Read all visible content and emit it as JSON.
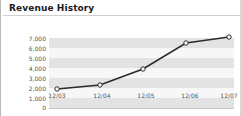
{
  "widget": {
    "title": "Revenue History"
  },
  "chart_data": {
    "type": "line",
    "title": "Revenue History",
    "xlabel": "",
    "ylabel": "",
    "categories": [
      "12/03",
      "12/04",
      "12/05",
      "12/06",
      "12/07"
    ],
    "values": [
      1900,
      2300,
      3900,
      6500,
      7100
    ],
    "series": [
      {
        "name": "Revenue",
        "values": [
          1900,
          2300,
          3900,
          6500,
          7100
        ]
      }
    ],
    "ylim": [
      0,
      7500
    ],
    "ytick_labels": [
      "7,000",
      "6,000",
      "5,000",
      "4,000",
      "3,000",
      "2,000",
      "1,000",
      "0"
    ],
    "ytick_values": [
      7000,
      6000,
      5000,
      4000,
      3000,
      2000,
      1000,
      0
    ],
    "grid": true,
    "legend": false,
    "marker": "open-circle",
    "line_color": "#2b2b2b",
    "marker_fill": "#ffffff",
    "band_color_dark": "#e3e3e3",
    "band_color_light": "#f7f7f7",
    "text_color": "#555555"
  }
}
